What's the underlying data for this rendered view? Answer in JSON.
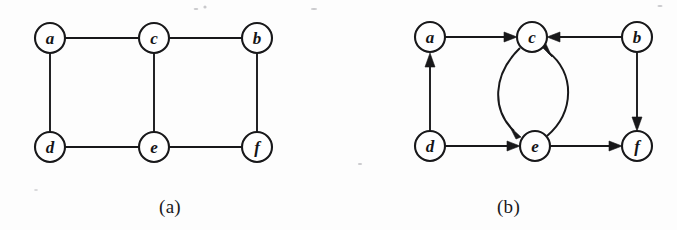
{
  "figure": {
    "panels": [
      {
        "id": "panel-a",
        "caption": "(a)",
        "graph_type": "undirected",
        "nodes": [
          {
            "id": "a",
            "label": "a",
            "x": 50,
            "y": 38
          },
          {
            "id": "c",
            "label": "c",
            "x": 154,
            "y": 38
          },
          {
            "id": "b",
            "label": "b",
            "x": 257,
            "y": 38
          },
          {
            "id": "d",
            "label": "d",
            "x": 50,
            "y": 147
          },
          {
            "id": "e",
            "label": "e",
            "x": 154,
            "y": 147
          },
          {
            "id": "f",
            "label": "f",
            "x": 257,
            "y": 147
          }
        ],
        "edges": [
          {
            "from": "a",
            "to": "c",
            "directed": false
          },
          {
            "from": "c",
            "to": "b",
            "directed": false
          },
          {
            "from": "a",
            "to": "d",
            "directed": false
          },
          {
            "from": "c",
            "to": "e",
            "directed": false
          },
          {
            "from": "b",
            "to": "f",
            "directed": false
          },
          {
            "from": "d",
            "to": "e",
            "directed": false
          },
          {
            "from": "e",
            "to": "f",
            "directed": false
          }
        ]
      },
      {
        "id": "panel-b",
        "caption": "(b)",
        "graph_type": "directed",
        "nodes": [
          {
            "id": "a",
            "label": "a",
            "x": 90,
            "y": 37
          },
          {
            "id": "c",
            "label": "c",
            "x": 192,
            "y": 37
          },
          {
            "id": "b",
            "label": "b",
            "x": 297,
            "y": 37
          },
          {
            "id": "d",
            "label": "d",
            "x": 90,
            "y": 146
          },
          {
            "id": "e",
            "label": "e",
            "x": 195,
            "y": 146
          },
          {
            "id": "f",
            "label": "f",
            "x": 297,
            "y": 146
          }
        ],
        "edges": [
          {
            "from": "a",
            "to": "c",
            "directed": true,
            "shape": "straight"
          },
          {
            "from": "b",
            "to": "c",
            "directed": true,
            "shape": "straight"
          },
          {
            "from": "d",
            "to": "a",
            "directed": true,
            "shape": "straight"
          },
          {
            "from": "b",
            "to": "f",
            "directed": true,
            "shape": "straight"
          },
          {
            "from": "d",
            "to": "e",
            "directed": true,
            "shape": "straight"
          },
          {
            "from": "e",
            "to": "f",
            "directed": true,
            "shape": "straight"
          },
          {
            "from": "c",
            "to": "e",
            "directed": true,
            "shape": "curve-left"
          },
          {
            "from": "e",
            "to": "c",
            "directed": true,
            "shape": "curve-right"
          }
        ]
      }
    ],
    "node_radius": 15,
    "colors": {
      "ink": "#18181a",
      "paper": "#fdfdfd",
      "node_fill": "#ffffff"
    }
  }
}
